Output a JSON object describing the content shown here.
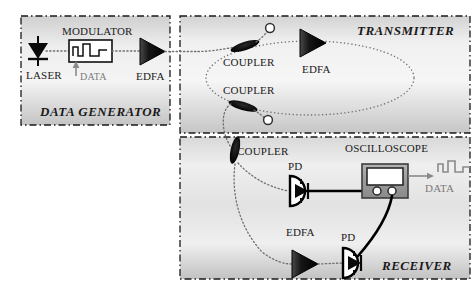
{
  "diagram": {
    "panels": [
      {
        "id": "data_generator",
        "label": "DATA GENERATOR"
      },
      {
        "id": "transmitter",
        "label": "TRANSMITTER"
      },
      {
        "id": "receiver",
        "label": "RECEIVER"
      }
    ],
    "colors": {
      "panel_fill_light": "#f2f2f2",
      "panel_fill_dark": "#c9c9c9",
      "border": "#1a1a1a",
      "component_fill": "#111111",
      "fiber": "#6e6e6e",
      "wire": "#000000",
      "scope_body": "#9a9a9a",
      "scope_screen": "#ffffff",
      "dim_text": "#7b7b7b"
    }
  },
  "data_generator": {
    "panel_label": "DATA GENERATOR",
    "laser_label": "LASER",
    "modulator_label": "MODULATOR",
    "data_input_label": "DATA",
    "edfa_label": "EDFA"
  },
  "transmitter": {
    "panel_label": "TRANSMITTER",
    "coupler_top_label": "COUPLER",
    "coupler_bottom_label": "COUPLER",
    "edfa_label": "EDFA"
  },
  "receiver": {
    "panel_label": "RECEIVER",
    "coupler_label": "COUPLER",
    "pd_top_label": "PD",
    "pd_bottom_label": "PD",
    "edfa_label": "EDFA",
    "oscilloscope_label": "OSCILLOSCOPE",
    "data_output_label": "DATA"
  }
}
